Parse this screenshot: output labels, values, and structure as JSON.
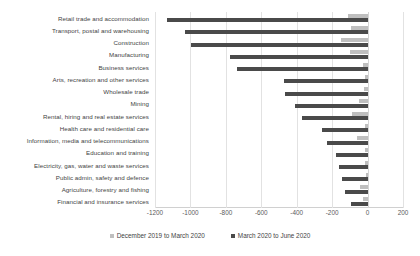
{
  "chart_data": {
    "type": "bar",
    "orientation": "horizontal",
    "title": "",
    "xlabel": "",
    "ylabel": "",
    "xlim": [
      -1200,
      200
    ],
    "xticks": [
      -1200,
      -1000,
      -800,
      -600,
      -400,
      -200,
      0,
      200
    ],
    "xticklabels": [
      "-1200",
      "-1000",
      "-800",
      "-600",
      "-400",
      "-200",
      "0",
      "200"
    ],
    "grid": true,
    "legend_position": "bottom",
    "categories": [
      "Retail trade and accommodation",
      "Transport, postal and warehousing",
      "Construction",
      "Manufacturing",
      "Business services",
      "Arts, recreation and other services",
      "Wholesale trade",
      "Mining",
      "Rental, hiring and real estate services",
      "Health care and residential care",
      "Information, media and telecommunications",
      "Education and training",
      "Electricity, gas, water and waste services",
      "Public admin, safety and defence",
      "Agriculture, forestry and fishing",
      "Financial and insurance services"
    ],
    "series": [
      {
        "name": "December 2019 to March 2020",
        "color": "#bfbfbf",
        "values": [
          -110,
          -95,
          -150,
          -100,
          -25,
          -15,
          -20,
          -50,
          -90,
          -15,
          -60,
          -15,
          -15,
          -10,
          -45,
          -25
        ]
      },
      {
        "name": "March 2020 to June 2020",
        "color": "#4a4a4a",
        "values": [
          -1130,
          -1030,
          -995,
          -775,
          -735,
          -470,
          -465,
          -410,
          -370,
          -260,
          -230,
          -180,
          -160,
          -145,
          -130,
          -95
        ]
      }
    ]
  },
  "legend": {
    "items": [
      {
        "label": "December 2019 to March 2020",
        "swatch": "legend-swatch-light"
      },
      {
        "label": "March 2020 to June 2020",
        "swatch": "legend-swatch-dark"
      }
    ]
  }
}
